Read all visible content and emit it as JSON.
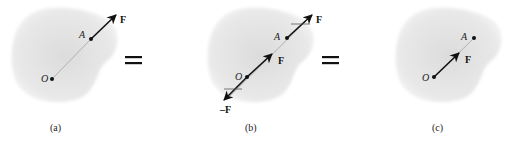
{
  "figure": {
    "colors": {
      "body_fill": "#e6e6e6",
      "body_edge": "#f7f7f7",
      "line": "#111111",
      "line_of_action": "#9a9a9a"
    },
    "panels": [
      {
        "id": "a",
        "caption": "(a)",
        "point_origin": "O",
        "point_a": "A",
        "force_label": "F"
      },
      {
        "id": "b",
        "caption": "(b)",
        "point_origin": "O",
        "point_a": "A",
        "force_label_top": "F",
        "force_label_mid": "F",
        "force_label_neg": "–F"
      },
      {
        "id": "c",
        "caption": "(c)",
        "point_origin": "O",
        "point_a": "A",
        "force_label": "F"
      }
    ],
    "equals": [
      "=",
      "="
    ]
  }
}
